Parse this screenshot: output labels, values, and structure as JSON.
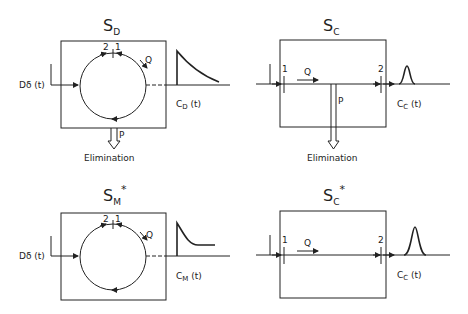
{
  "panels": {
    "sd": {
      "title_main": "S",
      "title_sub": "D",
      "title_star": "",
      "input_label": "Dδ (t)",
      "marker_2": "2",
      "marker_1": "1",
      "flow_label": "Q",
      "output_label_main": "C",
      "output_label_sub": "D",
      "output_label_arg": " (t)",
      "elimination_flow": "P",
      "elimination_label": "Elimination",
      "curve": "decay"
    },
    "sc": {
      "title_main": "S",
      "title_sub": "C",
      "title_star": "",
      "marker_1": "1",
      "marker_2": "2",
      "flow_label": "Q",
      "output_label_main": "C",
      "output_label_sub": "C",
      "output_label_arg": " (t)",
      "elimination_flow": "P",
      "elimination_label": "Elimination",
      "curve": "narrow-peak"
    },
    "sm": {
      "title_main": "S",
      "title_sub": "M",
      "title_star": "*",
      "input_label": "Dδ (t)",
      "marker_2": "2",
      "marker_1": "1",
      "flow_label": "Q",
      "output_label_main": "C",
      "output_label_sub": "M",
      "output_label_arg": " (t)",
      "curve": "decay-plateau"
    },
    "scstar": {
      "title_main": "S",
      "title_sub": "C",
      "title_star": "*",
      "marker_1": "1",
      "marker_2": "2",
      "flow_label": "Q",
      "output_label_main": "C",
      "output_label_sub": "C",
      "output_label_arg": " (t)",
      "curve": "wide-peak"
    }
  },
  "colors": {
    "ink": "#222222",
    "background": "#ffffff"
  }
}
